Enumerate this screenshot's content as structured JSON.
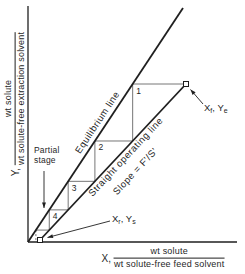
{
  "canvas": {
    "width": 245,
    "height": 274,
    "background": "#ffffff",
    "ink": "#1f1f1f",
    "step_color": "#666666"
  },
  "y_axis_label": {
    "symbol": "Y,",
    "numerator": "wt solute",
    "denominator": "wt solute-free extraction solvent"
  },
  "x_axis_label": {
    "symbol": "X,",
    "numerator": "wt solute",
    "denominator": "wt solute-free feed solvent"
  },
  "partial_stage_note": {
    "line1": "Partial",
    "line2": "stage"
  },
  "chart_data": {
    "type": "line",
    "title": "",
    "xlabel": "X, wt solute / wt solute-free feed solvent",
    "ylabel": "Y, wt solute / wt solute-free extraction solvent",
    "grid": false,
    "ticks": "none",
    "axes_px": {
      "origin": [
        28,
        242
      ],
      "x_end": [
        237,
        242
      ],
      "y_end": [
        28,
        6
      ]
    },
    "series": [
      {
        "name": "Equilibrium line",
        "shape": "straight",
        "from_px": [
          28,
          242
        ],
        "to_px": [
          183,
          8
        ]
      },
      {
        "name": "Straight operating line",
        "annotation": "Slope = F'/S'",
        "shape": "straight",
        "from_px": [
          40,
          240
        ],
        "to_px": [
          186,
          84
        ]
      }
    ],
    "points": [
      {
        "id": "feed",
        "label": "Xf, Ye",
        "parts": [
          {
            "t": "X"
          },
          {
            "t": "f",
            "sub": true
          },
          {
            "t": ", Y"
          },
          {
            "t": "e",
            "sub": true
          }
        ],
        "px": [
          186,
          84
        ],
        "marker": "open-square"
      },
      {
        "id": "raffinate",
        "label": "Xr, Ys",
        "parts": [
          {
            "t": "X"
          },
          {
            "t": "r",
            "sub": true
          },
          {
            "t": ", Y"
          },
          {
            "t": "s",
            "sub": true
          }
        ],
        "px": [
          40,
          240
        ],
        "marker": "open-square"
      }
    ],
    "stages": {
      "labels": [
        "1",
        "2",
        "3",
        "4"
      ],
      "partial": true
    }
  }
}
